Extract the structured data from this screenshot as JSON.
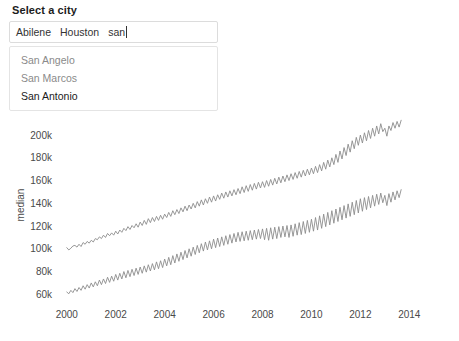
{
  "widget": {
    "label": "Select a city",
    "selected_tokens": [
      "Abilene",
      "Houston"
    ],
    "query": "san",
    "suggestions": [
      {
        "label": "San Angelo",
        "active": false
      },
      {
        "label": "San Marcos",
        "active": false
      },
      {
        "label": "San Antonio",
        "active": true
      }
    ]
  },
  "chart_data": {
    "type": "line",
    "title": "",
    "xlabel": "",
    "ylabel": "median",
    "xlim": [
      1999.6,
      2015.5
    ],
    "ylim": [
      55000,
      215000
    ],
    "xticks": [
      2000,
      2002,
      2004,
      2006,
      2008,
      2010,
      2012,
      2014
    ],
    "xtick_labels": [
      "2000",
      "2002",
      "2004",
      "2006",
      "2008",
      "2010",
      "2012",
      "2014"
    ],
    "yticks": [
      60000,
      80000,
      100000,
      120000,
      140000,
      160000,
      180000,
      200000
    ],
    "ytick_labels": [
      "60k",
      "80k",
      "100k",
      "120k",
      "140k",
      "160k",
      "180k",
      "200k"
    ],
    "grid": false,
    "legend": "none",
    "line_color": "#8c8c8c",
    "series": [
      {
        "name": "Houston",
        "values": [
          101000,
          99000,
          100500,
          102500,
          103000,
          101500,
          104000,
          102000,
          105500,
          104000,
          106500,
          105000,
          107500,
          106000,
          109000,
          108000,
          110500,
          109000,
          112000,
          110000,
          113500,
          111500,
          114000,
          112000,
          115500,
          113000,
          116500,
          114500,
          118000,
          116000,
          119500,
          117000,
          120500,
          118500,
          122000,
          119000,
          123500,
          120500,
          125000,
          121500,
          126500,
          123000,
          127500,
          124000,
          128500,
          125000,
          129500,
          126000,
          130500,
          127500,
          132000,
          128500,
          133500,
          130000,
          134500,
          131000,
          136000,
          132500,
          137500,
          133500,
          138500,
          135000,
          140000,
          136000,
          141500,
          137500,
          143000,
          138500,
          144000,
          140000,
          145500,
          141000,
          146500,
          142000,
          147500,
          143500,
          149000,
          144500,
          150000,
          145500,
          151000,
          146500,
          152000,
          147500,
          153000,
          148500,
          154500,
          149500,
          155500,
          150500,
          156500,
          151500,
          157500,
          152500,
          158500,
          153500,
          159000,
          154000,
          160000,
          155000,
          161000,
          156000,
          162000,
          157000,
          163000,
          158000,
          164000,
          159000,
          165000,
          160000,
          166000,
          161000,
          167000,
          162000,
          168000,
          163000,
          169000,
          164000,
          170000,
          165000,
          171000,
          166000,
          172500,
          167000,
          174000,
          168500,
          176000,
          170000,
          178000,
          172000,
          180000,
          174000,
          183000,
          176000,
          186000,
          179000,
          189000,
          182000,
          192000,
          185000,
          195000,
          188000,
          198000,
          191000,
          200000,
          193000,
          202000,
          195000,
          204000,
          197000,
          206000,
          199000,
          208000,
          201000,
          210000,
          203000,
          206000,
          199000,
          208000,
          204000,
          211000,
          206000,
          212000,
          207000,
          213000
        ]
      },
      {
        "name": "Abilene",
        "values": [
          62000,
          60500,
          63500,
          61500,
          65000,
          62500,
          66000,
          63500,
          67500,
          64500,
          68500,
          65500,
          70000,
          66500,
          71000,
          67500,
          72500,
          68500,
          73500,
          69500,
          75000,
          70500,
          76000,
          71500,
          77500,
          72500,
          78500,
          73500,
          80000,
          74500,
          81000,
          75500,
          82000,
          76500,
          83000,
          77500,
          84000,
          78500,
          85000,
          79500,
          86000,
          80500,
          87000,
          81500,
          88500,
          82500,
          89500,
          83500,
          91000,
          85000,
          92500,
          86000,
          94000,
          87500,
          95500,
          89000,
          97000,
          90500,
          98500,
          92000,
          100000,
          93500,
          101500,
          95000,
          103000,
          96500,
          104500,
          98000,
          106000,
          99000,
          107000,
          100000,
          108500,
          101000,
          109500,
          102000,
          110500,
          103000,
          111500,
          104000,
          112500,
          105000,
          113500,
          106000,
          114500,
          106500,
          115000,
          107000,
          115500,
          107500,
          116000,
          108000,
          116500,
          108500,
          117000,
          109000,
          117500,
          108000,
          118000,
          107500,
          118500,
          108500,
          119000,
          109000,
          119500,
          110000,
          120000,
          110500,
          120500,
          110000,
          121000,
          111000,
          122000,
          112000,
          123000,
          112500,
          124000,
          113500,
          125000,
          114500,
          126000,
          115500,
          127500,
          116500,
          129000,
          118000,
          130500,
          119500,
          132000,
          121000,
          133500,
          122500,
          135000,
          124000,
          136500,
          125500,
          138000,
          127000,
          139500,
          128500,
          141000,
          130000,
          142500,
          131500,
          144000,
          133000,
          145000,
          134500,
          146000,
          136000,
          147000,
          137500,
          148000,
          139000,
          149000,
          140500,
          147000,
          138000,
          148500,
          141000,
          150000,
          143000,
          151000,
          145000,
          152000
        ]
      }
    ]
  }
}
